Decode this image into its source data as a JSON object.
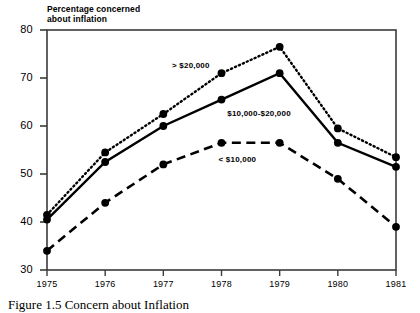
{
  "chart_data": {
    "type": "line",
    "title": "",
    "ylabel": "Percentage concerned about inflation",
    "xlabel": "",
    "x": [
      "1975",
      "1976",
      "1977",
      "1978",
      "1979",
      "1980",
      "1981"
    ],
    "categories": [
      "1975",
      "1976",
      "1977",
      "1978",
      "1979",
      "1980",
      "1981"
    ],
    "ylim": [
      30,
      80
    ],
    "yticks": [
      30,
      40,
      50,
      60,
      70,
      80
    ],
    "ytick_labels": [
      "30",
      "40",
      "50",
      "60",
      "70",
      "80"
    ],
    "grid": false,
    "legend_position": "inline-annotations",
    "series": [
      {
        "name": "> $20,000",
        "style": "dotted",
        "color": "#000000",
        "marker": "circle",
        "values": [
          41.5,
          54.5,
          62.5,
          71.0,
          76.5,
          59.5,
          53.5
        ]
      },
      {
        "name": "$10,000-$20,000",
        "style": "solid",
        "color": "#000000",
        "marker": "circle",
        "values": [
          40.5,
          52.5,
          60.0,
          65.5,
          71.0,
          56.5,
          51.5
        ]
      },
      {
        "name": "< $10,000",
        "style": "dashed",
        "color": "#000000",
        "marker": "circle",
        "values": [
          34.0,
          44.0,
          52.0,
          56.5,
          56.5,
          49.0,
          39.0
        ]
      }
    ],
    "annotations": [
      {
        "text": "> $20,000",
        "x": 1977.15,
        "y": 72.6
      },
      {
        "text": "$10,000-$20,000",
        "x": 1978.1,
        "y": 62.5
      },
      {
        "text": "< $10,000",
        "x": 1977.95,
        "y": 53.0
      }
    ]
  },
  "axis": {
    "y_title": "Percentage concerned\nabout inflation"
  },
  "caption": {
    "text": "Figure 1.5  Concern about Inflation"
  }
}
